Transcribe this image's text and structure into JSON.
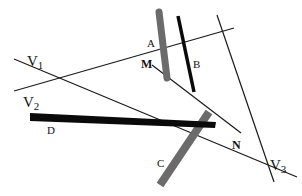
{
  "diagram": {
    "labels": {
      "V1": "V",
      "V1_sub": "1",
      "V2": "V",
      "V2_sub": "2",
      "V3": "V",
      "V3_sub": "3",
      "A": "A",
      "B": "B",
      "C": "C",
      "D": "D",
      "M": "M",
      "N": "N"
    },
    "colors": {
      "thin_line": "#1a1a1a",
      "bar_gray": "#6b6b6b",
      "bar_black": "#0a0a0a"
    }
  }
}
